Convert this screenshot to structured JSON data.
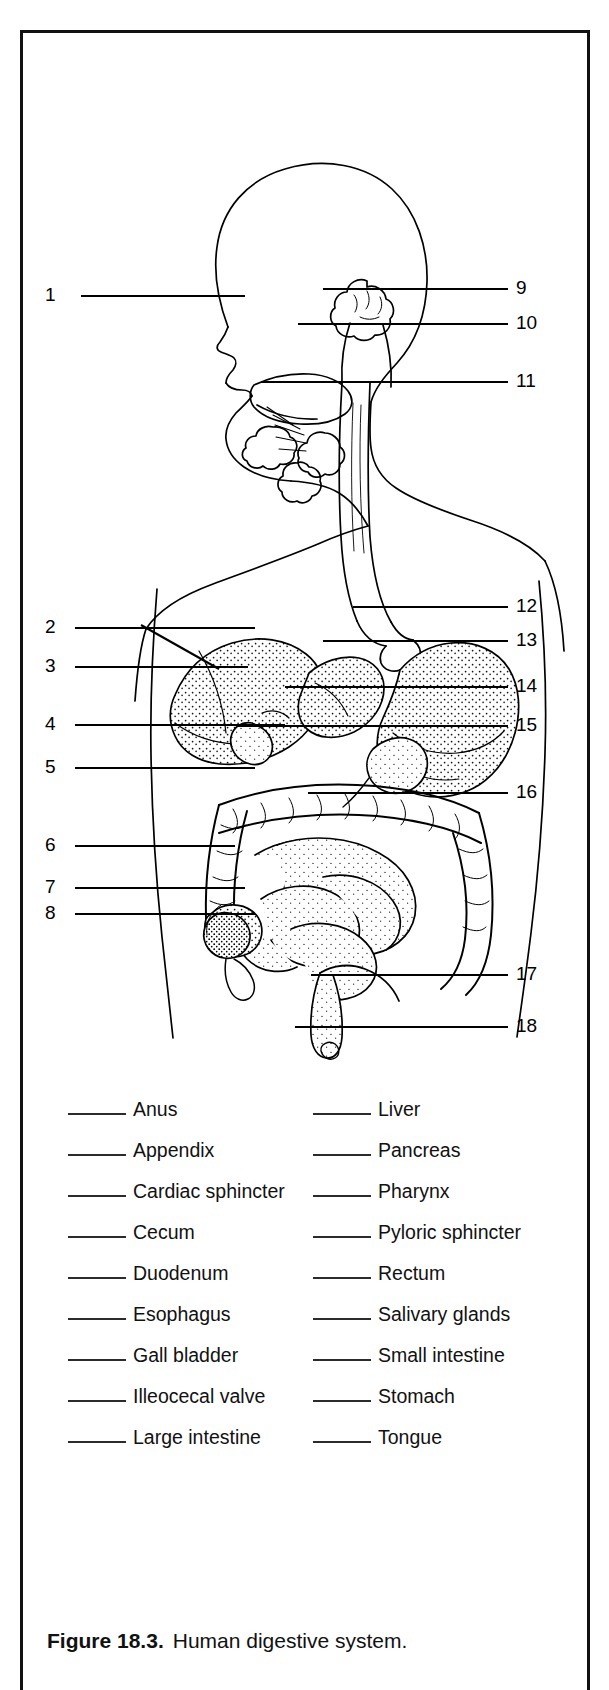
{
  "figure": {
    "caption_label": "Figure 18.3.",
    "caption_text": "Human digestive system.",
    "title": "Human digestive system",
    "border_color": "#111111",
    "ink_color": "#000000",
    "background_color": "#ffffff"
  },
  "leaders": {
    "left": [
      {
        "number": "1",
        "x": 62,
        "y": 274,
        "line_x1": 78,
        "line_x2": 222,
        "line_y": 283
      },
      {
        "number": "2",
        "x": 54,
        "y": 616,
        "line_x1": 72,
        "line_x2": 232,
        "line_y": 625
      },
      {
        "number": "3",
        "x": 54,
        "y": 655,
        "line_x1": 72,
        "line_x2": 225,
        "line_y": 664
      },
      {
        "number": "4",
        "x": 54,
        "y": 713,
        "line_x1": 72,
        "line_x2": 262,
        "line_y": 722
      },
      {
        "number": "5",
        "x": 54,
        "y": 756,
        "line_x1": 72,
        "line_x2": 232,
        "line_y": 765
      },
      {
        "number": "6",
        "x": 54,
        "y": 834,
        "line_x1": 72,
        "line_x2": 212,
        "line_y": 843
      },
      {
        "number": "7",
        "x": 54,
        "y": 876,
        "line_x1": 72,
        "line_x2": 222,
        "line_y": 885
      },
      {
        "number": "8",
        "x": 54,
        "y": 902,
        "line_x1": 72,
        "line_x2": 232,
        "line_y": 911
      }
    ],
    "right": [
      {
        "number": "9",
        "x": 513,
        "y": 277,
        "line_x1": 300,
        "line_x2": 505,
        "line_y": 286
      },
      {
        "number": "10",
        "x": 506,
        "y": 312,
        "line_x1": 275,
        "line_x2": 500,
        "line_y": 321
      },
      {
        "number": "11",
        "x": 506,
        "y": 370,
        "line_x1": 238,
        "line_x2": 500,
        "line_y": 379
      },
      {
        "number": "12",
        "x": 506,
        "y": 595,
        "line_x1": 330,
        "line_x2": 500,
        "line_y": 604
      },
      {
        "number": "13",
        "x": 506,
        "y": 629,
        "line_x1": 300,
        "line_x2": 500,
        "line_y": 638
      },
      {
        "number": "14",
        "x": 506,
        "y": 675,
        "line_x1": 262,
        "line_x2": 500,
        "line_y": 684
      },
      {
        "number": "15",
        "x": 506,
        "y": 714,
        "line_x1": 215,
        "line_x2": 500,
        "line_y": 723
      },
      {
        "number": "16",
        "x": 506,
        "y": 781,
        "line_x1": 285,
        "line_x2": 500,
        "line_y": 790
      },
      {
        "number": "17",
        "x": 506,
        "y": 963,
        "line_x1": 288,
        "line_x2": 500,
        "line_y": 972
      },
      {
        "number": "18",
        "x": 506,
        "y": 1015,
        "line_x1": 272,
        "line_x2": 500,
        "line_y": 1024
      }
    ]
  },
  "word_bank": {
    "column_left": [
      {
        "label": "Anus"
      },
      {
        "label": "Appendix"
      },
      {
        "label": "Cardiac sphincter"
      },
      {
        "label": "Cecum"
      },
      {
        "label": "Duodenum"
      },
      {
        "label": "Esophagus"
      },
      {
        "label": "Gall bladder"
      },
      {
        "label": "Illeocecal valve"
      },
      {
        "label": "Large intestine"
      }
    ],
    "column_right": [
      {
        "label": "Liver"
      },
      {
        "label": "Pancreas"
      },
      {
        "label": "Pharynx"
      },
      {
        "label": "Pyloric sphincter"
      },
      {
        "label": "Rectum"
      },
      {
        "label": "Salivary glands"
      },
      {
        "label": "Small intestine"
      },
      {
        "label": "Stomach"
      },
      {
        "label": "Tongue"
      }
    ]
  },
  "illustration": {
    "description": "Line drawing of a human head, neck and torso in profile with the digestive tract rendered in stippled detail",
    "parts": [
      "head-profile",
      "neck",
      "torso-outline",
      "tongue",
      "salivary-glands",
      "pharynx",
      "esophagus",
      "stomach",
      "liver",
      "gall-bladder",
      "pancreas",
      "duodenum",
      "small-intestine",
      "large-intestine",
      "cecum",
      "appendix",
      "rectum",
      "anus"
    ]
  }
}
